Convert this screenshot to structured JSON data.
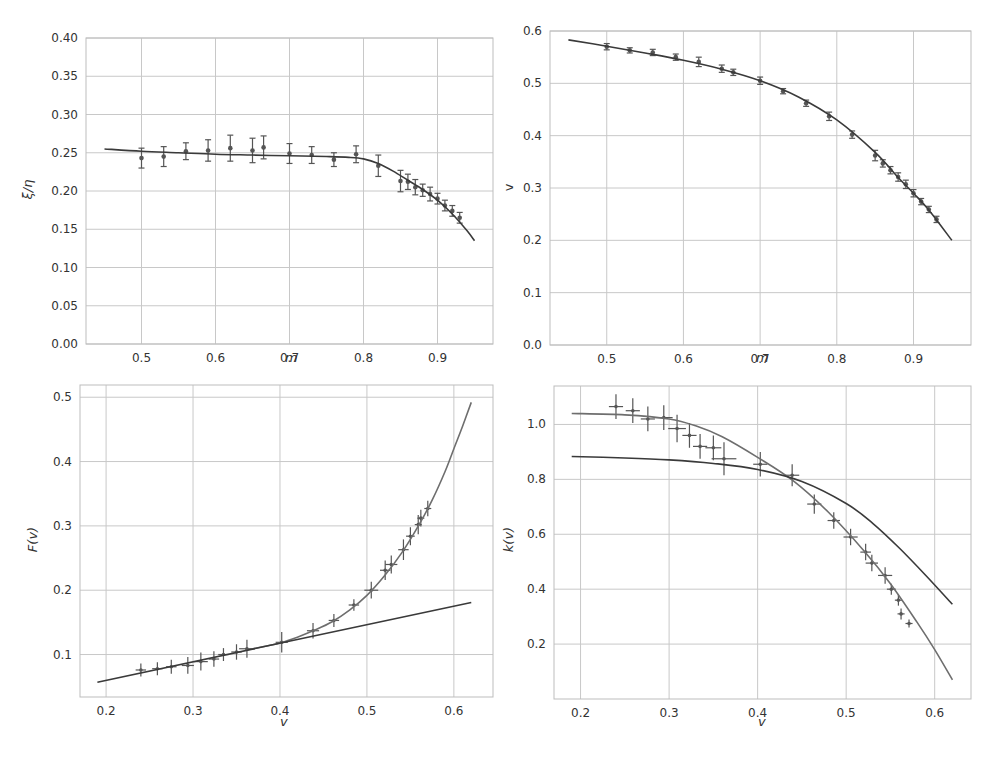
{
  "figure": {
    "panels": [
      {
        "id": "top-left",
        "xlabel": "m",
        "ylabel": "ξ/η"
      },
      {
        "id": "top-right",
        "xlabel": "m",
        "ylabel": "v"
      },
      {
        "id": "bottom-left",
        "xlabel": "v",
        "ylabel": "F(v)"
      },
      {
        "id": "bottom-right",
        "xlabel": "v",
        "ylabel": "k(v)"
      }
    ]
  },
  "colors": {
    "fit_dark": "#3a3a3a",
    "fit_light": "#6e6e6e",
    "points": "#555555",
    "grid": "#c8c8c8"
  },
  "chart_data": [
    {
      "type": "scatter",
      "title": "",
      "xlabel": "m",
      "ylabel": "ξ/η",
      "xlim": [
        0.425,
        0.975
      ],
      "ylim": [
        0.0,
        0.4
      ],
      "xticks": [
        0.5,
        0.6,
        0.7,
        0.8,
        0.9
      ],
      "yticks": [
        0.0,
        0.05,
        0.1,
        0.15,
        0.2,
        0.25,
        0.3,
        0.35,
        0.4
      ],
      "ytick_labels": [
        "0.00",
        "0.05",
        "0.10",
        "0.15",
        "0.20",
        "0.25",
        "0.30",
        "0.35",
        "0.40"
      ],
      "xtick_labels": [
        "0.5",
        "0.6",
        "0.7",
        "0.8",
        "0.9"
      ],
      "grid": true,
      "series": [
        {
          "name": "data",
          "kind": "errorbar",
          "x": [
            0.5,
            0.53,
            0.56,
            0.59,
            0.62,
            0.65,
            0.665,
            0.7,
            0.73,
            0.76,
            0.79,
            0.82,
            0.85,
            0.86,
            0.87,
            0.88,
            0.89,
            0.9,
            0.91,
            0.92,
            0.93
          ],
          "y": [
            0.243,
            0.245,
            0.252,
            0.253,
            0.256,
            0.253,
            0.257,
            0.249,
            0.247,
            0.241,
            0.248,
            0.233,
            0.213,
            0.212,
            0.205,
            0.201,
            0.196,
            0.19,
            0.181,
            0.174,
            0.165
          ],
          "yerr": [
            0.013,
            0.013,
            0.011,
            0.014,
            0.017,
            0.016,
            0.015,
            0.013,
            0.011,
            0.009,
            0.011,
            0.014,
            0.014,
            0.01,
            0.01,
            0.008,
            0.009,
            0.007,
            0.007,
            0.007,
            0.007
          ]
        },
        {
          "name": "fit",
          "kind": "line",
          "x": [
            0.45,
            0.5,
            0.55,
            0.6,
            0.65,
            0.7,
            0.75,
            0.78,
            0.8,
            0.82,
            0.84,
            0.86,
            0.88,
            0.9,
            0.92,
            0.94,
            0.95
          ],
          "y": [
            0.255,
            0.252,
            0.25,
            0.248,
            0.247,
            0.246,
            0.245,
            0.244,
            0.242,
            0.236,
            0.226,
            0.214,
            0.202,
            0.188,
            0.17,
            0.148,
            0.135
          ]
        }
      ]
    },
    {
      "type": "scatter",
      "title": "",
      "xlabel": "m",
      "ylabel": "v",
      "xlim": [
        0.426,
        0.975
      ],
      "ylim": [
        0.0,
        0.6
      ],
      "xticks": [
        0.5,
        0.6,
        0.7,
        0.8,
        0.9
      ],
      "yticks": [
        0.0,
        0.1,
        0.2,
        0.3,
        0.4,
        0.5,
        0.6
      ],
      "xtick_labels": [
        "0.5",
        "0.6",
        "0.7",
        "0.8",
        "0.9"
      ],
      "ytick_labels": [
        "0.0",
        "0.1",
        "0.2",
        "0.3",
        "0.4",
        "0.5",
        "0.6"
      ],
      "grid": true,
      "series": [
        {
          "name": "data",
          "kind": "errorbar",
          "x": [
            0.5,
            0.53,
            0.56,
            0.59,
            0.62,
            0.65,
            0.665,
            0.7,
            0.73,
            0.76,
            0.79,
            0.82,
            0.85,
            0.86,
            0.87,
            0.88,
            0.89,
            0.9,
            0.91,
            0.92,
            0.93
          ],
          "y": [
            0.57,
            0.563,
            0.559,
            0.55,
            0.541,
            0.528,
            0.521,
            0.505,
            0.485,
            0.462,
            0.437,
            0.402,
            0.362,
            0.347,
            0.334,
            0.321,
            0.307,
            0.29,
            0.274,
            0.259,
            0.24
          ],
          "yerr": [
            0.006,
            0.005,
            0.006,
            0.006,
            0.009,
            0.007,
            0.006,
            0.007,
            0.005,
            0.006,
            0.008,
            0.007,
            0.01,
            0.007,
            0.007,
            0.008,
            0.008,
            0.007,
            0.006,
            0.006,
            0.006
          ]
        },
        {
          "name": "fit",
          "kind": "line",
          "x": [
            0.45,
            0.5,
            0.55,
            0.6,
            0.65,
            0.7,
            0.75,
            0.8,
            0.85,
            0.88,
            0.9,
            0.92,
            0.95
          ],
          "y": [
            0.583,
            0.571,
            0.558,
            0.544,
            0.527,
            0.505,
            0.474,
            0.43,
            0.368,
            0.32,
            0.29,
            0.258,
            0.2
          ]
        }
      ]
    },
    {
      "type": "scatter",
      "title": "",
      "xlabel": "v",
      "ylabel": "F(v)",
      "xlim": [
        0.17,
        0.645
      ],
      "ylim": [
        0.034,
        0.519
      ],
      "xticks": [
        0.2,
        0.3,
        0.4,
        0.5,
        0.6
      ],
      "yticks": [
        0.1,
        0.2,
        0.3,
        0.4,
        0.5
      ],
      "xtick_labels": [
        "0.2",
        "0.3",
        "0.4",
        "0.5",
        "0.6"
      ],
      "ytick_labels": [
        "0.1",
        "0.2",
        "0.3",
        "0.4",
        "0.5"
      ],
      "grid": true,
      "series": [
        {
          "name": "data",
          "kind": "errorbar_xy",
          "x": [
            0.24,
            0.259,
            0.275,
            0.294,
            0.309,
            0.324,
            0.335,
            0.35,
            0.362,
            0.402,
            0.438,
            0.462,
            0.485,
            0.505,
            0.521,
            0.528,
            0.542,
            0.55,
            0.559,
            0.562,
            0.57
          ],
          "y": [
            0.076,
            0.078,
            0.081,
            0.083,
            0.089,
            0.093,
            0.1,
            0.104,
            0.109,
            0.119,
            0.137,
            0.153,
            0.177,
            0.2,
            0.231,
            0.24,
            0.263,
            0.284,
            0.302,
            0.312,
            0.327
          ],
          "xerr": [
            0.006,
            0.006,
            0.006,
            0.007,
            0.008,
            0.006,
            0.006,
            0.006,
            0.009,
            0.007,
            0.007,
            0.006,
            0.006,
            0.008,
            0.006,
            0.007,
            0.006,
            0.005,
            0.004,
            0.004,
            0.004
          ],
          "yerr": [
            0.01,
            0.01,
            0.011,
            0.013,
            0.014,
            0.012,
            0.01,
            0.012,
            0.014,
            0.016,
            0.012,
            0.01,
            0.009,
            0.013,
            0.015,
            0.014,
            0.016,
            0.014,
            0.015,
            0.013,
            0.012
          ]
        },
        {
          "name": "fit-curve",
          "kind": "line",
          "color": "light",
          "x": [
            0.36,
            0.38,
            0.4,
            0.42,
            0.44,
            0.46,
            0.48,
            0.5,
            0.52,
            0.54,
            0.56,
            0.575,
            0.59,
            0.6,
            0.61,
            0.62
          ],
          "y": [
            0.107,
            0.112,
            0.118,
            0.127,
            0.138,
            0.151,
            0.169,
            0.192,
            0.222,
            0.258,
            0.302,
            0.34,
            0.385,
            0.42,
            0.455,
            0.492
          ]
        },
        {
          "name": "fit-linear",
          "kind": "line",
          "color": "dark",
          "x": [
            0.19,
            0.62
          ],
          "y": [
            0.057,
            0.181
          ]
        }
      ]
    },
    {
      "type": "scatter",
      "title": "",
      "xlabel": "v",
      "ylabel": "k(v)",
      "xlim": [
        0.17,
        0.641
      ],
      "ylim": [
        0.0,
        1.14
      ],
      "xticks": [
        0.2,
        0.3,
        0.4,
        0.5,
        0.6
      ],
      "yticks": [
        0.2,
        0.4,
        0.6,
        0.8,
        1.0
      ],
      "xtick_labels": [
        "0.2",
        "0.3",
        "0.4",
        "0.5",
        "0.6"
      ],
      "ytick_labels": [
        "0.2",
        "0.4",
        "0.6",
        "0.8",
        "1.0"
      ],
      "grid": true,
      "series": [
        {
          "name": "data",
          "kind": "errorbar_xy",
          "x": [
            0.24,
            0.259,
            0.276,
            0.294,
            0.309,
            0.323,
            0.335,
            0.35,
            0.362,
            0.403,
            0.439,
            0.464,
            0.486,
            0.505,
            0.522,
            0.529,
            0.544,
            0.551,
            0.559,
            0.562,
            0.571
          ],
          "y": [
            1.065,
            1.05,
            1.02,
            1.025,
            0.985,
            0.96,
            0.92,
            0.915,
            0.875,
            0.855,
            0.815,
            0.71,
            0.65,
            0.59,
            0.535,
            0.495,
            0.45,
            0.4,
            0.36,
            0.31,
            0.275
          ],
          "xerr": [
            0.008,
            0.008,
            0.008,
            0.01,
            0.01,
            0.008,
            0.008,
            0.009,
            0.014,
            0.008,
            0.008,
            0.008,
            0.007,
            0.008,
            0.006,
            0.007,
            0.008,
            0.005,
            0.004,
            0.004,
            0.004
          ],
          "yerr": [
            0.045,
            0.045,
            0.045,
            0.045,
            0.05,
            0.045,
            0.045,
            0.045,
            0.06,
            0.045,
            0.04,
            0.035,
            0.03,
            0.03,
            0.03,
            0.03,
            0.03,
            0.02,
            0.02,
            0.02,
            0.015
          ]
        },
        {
          "name": "fit-steep",
          "kind": "line",
          "color": "light",
          "x": [
            0.19,
            0.25,
            0.3,
            0.33,
            0.36,
            0.4,
            0.44,
            0.48,
            0.52,
            0.55,
            0.58,
            0.6,
            0.62
          ],
          "y": [
            1.04,
            1.035,
            1.02,
            0.995,
            0.955,
            0.88,
            0.795,
            0.68,
            0.54,
            0.42,
            0.28,
            0.18,
            0.07
          ]
        },
        {
          "name": "fit-shallow",
          "kind": "line",
          "color": "dark",
          "x": [
            0.19,
            0.25,
            0.3,
            0.35,
            0.4,
            0.45,
            0.5,
            0.53,
            0.56,
            0.59,
            0.62
          ],
          "y": [
            0.883,
            0.878,
            0.871,
            0.858,
            0.836,
            0.792,
            0.712,
            0.64,
            0.55,
            0.45,
            0.345
          ]
        }
      ]
    }
  ]
}
